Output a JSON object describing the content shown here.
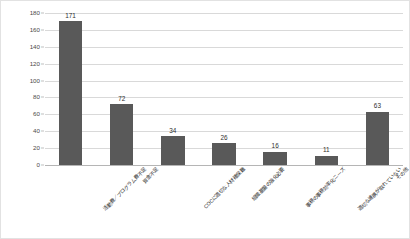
{
  "chart_data": {
    "type": "bar",
    "title": "",
    "xlabel": "",
    "ylabel": "",
    "ylim": [
      0,
      180
    ],
    "ytick_step": 20,
    "yticks": [
      0,
      20,
      40,
      60,
      80,
      100,
      120,
      140,
      160,
      180
    ],
    "ytick_labels": [
      "0",
      "20",
      "40",
      "60",
      "80",
      "100",
      "120",
      "140",
      "160",
      "180"
    ],
    "grid": true,
    "legend": false,
    "bar_color": "#595959",
    "gridline_color": "#d9d9d9",
    "categories": [
      "活動費／プログラム費不足",
      "資金不足",
      "COCに適切な人材確保難",
      "組織基盤の強化必要",
      "事務の事務効率化ニーズ",
      "適切な連携が取れていない",
      "その他"
    ],
    "values": [
      171,
      72,
      34,
      26,
      16,
      11,
      63
    ],
    "data_labels": [
      "171",
      "72",
      "34",
      "26",
      "16",
      "11",
      "63"
    ]
  }
}
